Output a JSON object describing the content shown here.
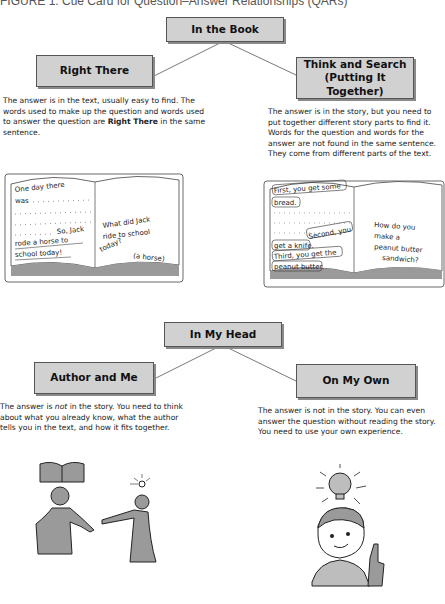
{
  "figure": {
    "caption": "FIGURE 1. Cue Card for Question–Answer Relationships (QARs)"
  },
  "in_the_book": {
    "title": "In the Book",
    "right_there": {
      "title": "Right There",
      "description_parts": [
        "The answer is in the text, usually easy to find. The words used to make up the question and words used to answer the question are ",
        "Right There",
        " in the same sentence."
      ],
      "illustration": {
        "left_page": [
          "One day there",
          "was",
          "So, Jack",
          "rode a horse to",
          "school today!"
        ],
        "right_page": [
          "What did Jack",
          "ride to school",
          "today?",
          "(a horse)"
        ]
      }
    },
    "think_and_search": {
      "title_line1": "Think and Search",
      "title_line2": "(Putting It Together)",
      "description": "The answer is in the story, but you need to put together different story parts to find it. Words for the question and words for the answer are not found in the same sentence. They come from different parts of the text.",
      "illustration": {
        "left_page": [
          "First, you get some",
          "bread.",
          "Second, you",
          "get a knife.",
          "Third, you get the",
          "peanut butter."
        ],
        "right_page": [
          "How do you",
          "make a",
          "peanut butter",
          "sandwich?"
        ]
      }
    }
  },
  "in_my_head": {
    "title": "In My Head",
    "author_and_me": {
      "title": "Author and Me",
      "description_parts": [
        "The answer is ",
        "not",
        " in the story. You need to think about what you already know, what the author tells you in the text, and how it fits together."
      ]
    },
    "on_my_own": {
      "title": "On My Own",
      "description": "The answer is not in the story. You can even answer the question without reading the story. You need to use your own experience."
    }
  },
  "colors": {
    "box_fill": "#d1d1d1",
    "box_border": "#555555",
    "line": "#555555"
  }
}
